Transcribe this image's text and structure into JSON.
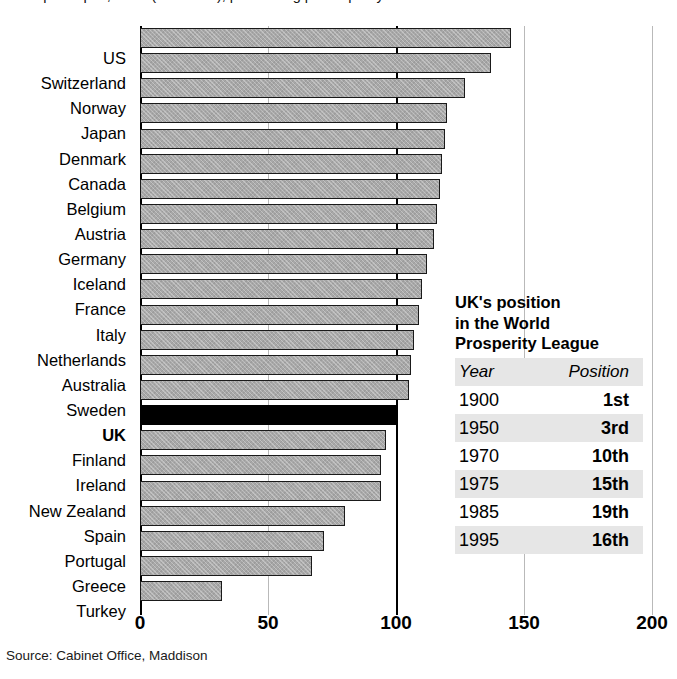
{
  "chart_data": {
    "type": "bar",
    "orientation": "horizontal",
    "title": "GDP per capita, 1995 (UK = 100), purchasing power parity",
    "xlabel": "",
    "ylabel": "",
    "xlim": [
      0,
      200
    ],
    "xticks": [
      0,
      50,
      100,
      150,
      200
    ],
    "xtick_labels": [
      "0",
      "50",
      "100",
      "150",
      "200"
    ],
    "grid": true,
    "reference_line": 100,
    "highlight_category": "UK",
    "categories": [
      "US",
      "Switzerland",
      "Norway",
      "Japan",
      "Denmark",
      "Canada",
      "Belgium",
      "Austria",
      "Germany",
      "Iceland",
      "France",
      "Italy",
      "Netherlands",
      "Australia",
      "Sweden",
      "UK",
      "Finland",
      "Ireland",
      "New Zealand",
      "Spain",
      "Portugal",
      "Greece",
      "Turkey"
    ],
    "values": [
      145,
      137,
      127,
      120,
      119,
      118,
      117,
      116,
      115,
      112,
      110,
      109,
      107,
      106,
      105,
      100,
      96,
      94,
      94,
      80,
      72,
      67,
      32
    ],
    "source": "Source: Cabinet Office, Maddison",
    "colors": {
      "bar_fill": "#a8a8a8",
      "bar_stroke": "#1a1a1a",
      "highlight_fill": "#000000",
      "gridline": "#b9b9b9",
      "axis": "#000000",
      "table_band": "#e6e6e6"
    }
  },
  "inset": {
    "heading_lines": [
      "UK's position",
      "in the World",
      "Prosperity League"
    ],
    "columns": [
      "Year",
      "Position"
    ],
    "rows": [
      {
        "year": "1900",
        "position": "1st"
      },
      {
        "year": "1950",
        "position": "3rd"
      },
      {
        "year": "1970",
        "position": "10th"
      },
      {
        "year": "1975",
        "position": "15th"
      },
      {
        "year": "1985",
        "position": "19th"
      },
      {
        "year": "1995",
        "position": "16th"
      }
    ]
  }
}
